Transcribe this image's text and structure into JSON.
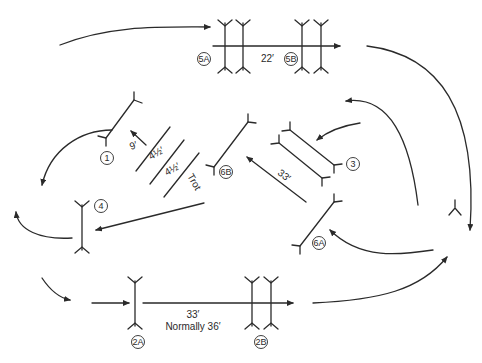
{
  "diagram": {
    "type": "jumping-course-layout",
    "ink_color": "#2a2a2a",
    "background": "#ffffff",
    "fences": [
      {
        "id": "1",
        "label": "1"
      },
      {
        "id": "2A",
        "label": "2A"
      },
      {
        "id": "2B",
        "label": "2B"
      },
      {
        "id": "3",
        "label": "3"
      },
      {
        "id": "4",
        "label": "4"
      },
      {
        "id": "5A",
        "label": "5A"
      },
      {
        "id": "5B",
        "label": "5B"
      },
      {
        "id": "6A",
        "label": "6A"
      },
      {
        "id": "6B",
        "label": "6B"
      }
    ],
    "distances": {
      "d_5a_5b": "22′",
      "d_ground_1": "9′",
      "d_pole1": "4½′",
      "d_pole2": "4½′",
      "trot": "Trot",
      "d_6a_6b": "33′",
      "d_2a_2b": "33′",
      "d_2a_2b_note": "Normally 36′"
    }
  }
}
